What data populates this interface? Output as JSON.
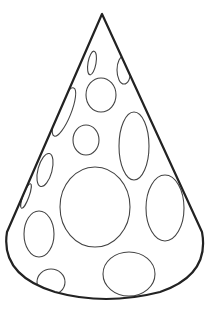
{
  "image": {
    "subject": "party hat line drawing",
    "background": "#ffffff",
    "stroke_color": "#222222",
    "dot_stroke_color": "#444444",
    "dots": [
      {
        "cx": 92,
        "cy": 63,
        "rx": 4,
        "ry": 12,
        "rot": 10
      },
      {
        "cx": 124,
        "cy": 70,
        "rx": 7,
        "ry": 14,
        "rot": 0
      },
      {
        "cx": 101,
        "cy": 95,
        "rx": 15,
        "ry": 17,
        "rot": 0
      },
      {
        "cx": 64,
        "cy": 112,
        "rx": 7,
        "ry": 26,
        "rot": 22
      },
      {
        "cx": 86,
        "cy": 140,
        "rx": 13,
        "ry": 15,
        "rot": 0
      },
      {
        "cx": 134,
        "cy": 146,
        "rx": 15,
        "ry": 34,
        "rot": 0
      },
      {
        "cx": 45,
        "cy": 170,
        "rx": 7,
        "ry": 17,
        "rot": 15
      },
      {
        "cx": 95,
        "cy": 207,
        "rx": 35,
        "ry": 40,
        "rot": 0
      },
      {
        "cx": 165,
        "cy": 208,
        "rx": 19,
        "ry": 33,
        "rot": 0
      },
      {
        "cx": 26,
        "cy": 196,
        "rx": 3,
        "ry": 13,
        "rot": 20
      },
      {
        "cx": 39,
        "cy": 234,
        "rx": 15,
        "ry": 23,
        "rot": 0
      },
      {
        "cx": 129,
        "cy": 274,
        "rx": 26,
        "ry": 22,
        "rot": 0
      },
      {
        "cx": 51,
        "cy": 282,
        "rx": 14,
        "ry": 13,
        "rot": 0
      }
    ]
  }
}
